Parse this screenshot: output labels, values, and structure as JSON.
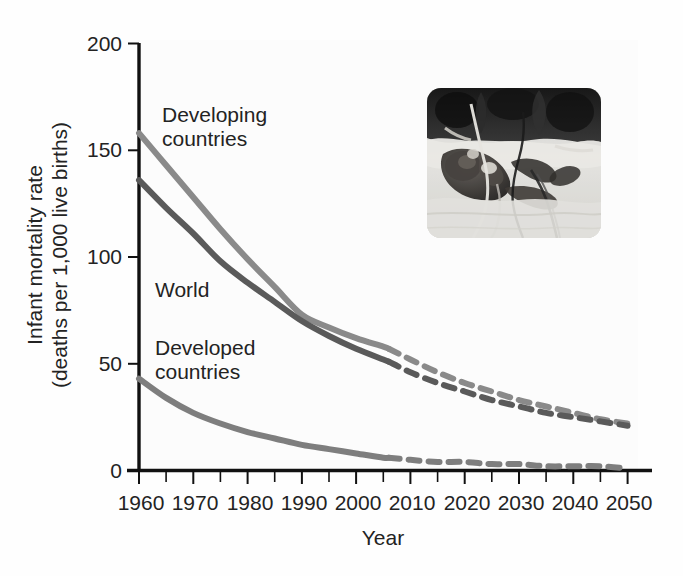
{
  "figure": {
    "kind": "line-chart-with-photo-inset",
    "background_color": "#fefefe",
    "text_color": "#232323"
  },
  "axes": {
    "y_title_line1": "Infant mortality rate",
    "y_title_line2": "(deaths per 1,000 live births)",
    "x_title": "Year",
    "y_ticks": [
      "0",
      "50",
      "100",
      "150",
      "200"
    ],
    "x_ticks": [
      "1960",
      "1970",
      "1980",
      "1990",
      "2000",
      "2010",
      "2020",
      "2030",
      "2040",
      "2050"
    ]
  },
  "series_labels": {
    "developing_line1": "Developing",
    "developing_line2": "countries",
    "world": "World",
    "developed_line1": "Developed",
    "developed_line2": "countries"
  },
  "inset": {
    "alt": "premature-infant-in-incubator-photo",
    "caption": ""
  },
  "colors": {
    "developing": "#8a8a8a",
    "world": "#5a5a5a",
    "developed": "#7e7e7e",
    "axis": "#111111",
    "text": "#232323"
  },
  "chart_data": {
    "type": "line",
    "title": "",
    "subtitle": "",
    "xlabel": "Year",
    "ylabel": "Infant mortality rate (deaths per 1,000 live births)",
    "xlim": [
      1960,
      2050
    ],
    "ylim": [
      0,
      200
    ],
    "yticks": [
      0,
      50,
      100,
      150,
      200
    ],
    "xticks": [
      1960,
      1970,
      1980,
      1990,
      2000,
      2010,
      2020,
      2030,
      2040,
      2050
    ],
    "x_minor_tick_interval": 5,
    "grid": false,
    "legend": "inline-labels",
    "projection_starts_at": 2006,
    "projection_style": "dashed",
    "historical_style": "solid",
    "x": [
      1960,
      1965,
      1970,
      1975,
      1980,
      1985,
      1990,
      1995,
      2000,
      2005,
      2006,
      2010,
      2015,
      2020,
      2025,
      2030,
      2035,
      2040,
      2045,
      2050
    ],
    "series": [
      {
        "name": "Developing countries",
        "color": "#8a8a8a",
        "label_position": "upper-left",
        "values": [
          158,
          143,
          128,
          113,
          99,
          86,
          73,
          67,
          62,
          58,
          57,
          52,
          46,
          41,
          37,
          33,
          30,
          27,
          24,
          22
        ]
      },
      {
        "name": "World",
        "color": "#5a5a5a",
        "label_position": "middle-left",
        "values": [
          136,
          123,
          111,
          98,
          88,
          79,
          70,
          63,
          57,
          52,
          51,
          46,
          41,
          37,
          33,
          30,
          27,
          25,
          23,
          21
        ]
      },
      {
        "name": "Developed countries",
        "color": "#7e7e7e",
        "label_position": "lower-left",
        "values": [
          43,
          34,
          27,
          22,
          18,
          15,
          12,
          10,
          8,
          6,
          6,
          5,
          4,
          4,
          3,
          3,
          2,
          2,
          2,
          1
        ]
      }
    ],
    "annotations": [
      {
        "text": "Developing countries",
        "x": 1968,
        "y": 180
      },
      {
        "text": "World",
        "x": 1967,
        "y": 92
      },
      {
        "text": "Developed countries",
        "x": 1968,
        "y": 57
      }
    ]
  }
}
